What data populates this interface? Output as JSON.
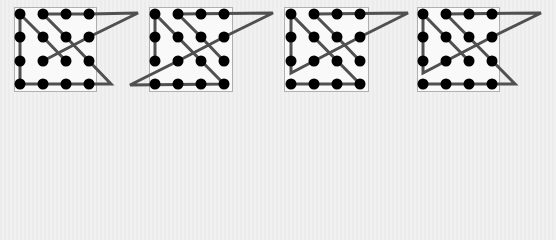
{
  "colors": {
    "background": "#eeeeee",
    "box_fill": "#f9f9f9",
    "box_border": "#b0b0b0",
    "line": "#505050",
    "dot": "#000000"
  },
  "grid": {
    "rows_y": [
      14,
      37,
      61,
      84
    ],
    "dot_radius": 5.5
  },
  "panels": [
    {
      "name": "panel-1",
      "box": {
        "x": 14,
        "y": 7,
        "w": 82,
        "h": 84
      },
      "cols_x": [
        20,
        43,
        66,
        89
      ],
      "path": [
        [
          66,
          61
        ],
        [
          43,
          37
        ],
        [
          20,
          14
        ],
        [
          20,
          84
        ],
        [
          111,
          84
        ],
        [
          89,
          61
        ],
        [
          66,
          37
        ],
        [
          43,
          14
        ],
        [
          89,
          14
        ],
        [
          138,
          13
        ],
        [
          89,
          37
        ],
        [
          43,
          61
        ]
      ]
    },
    {
      "name": "panel-2",
      "box": {
        "x": 149,
        "y": 7,
        "w": 83,
        "h": 84
      },
      "cols_x": [
        155,
        178,
        201,
        224
      ],
      "path": [
        [
          224,
          61
        ],
        [
          201,
          37
        ],
        [
          178,
          14
        ],
        [
          273,
          13
        ],
        [
          224,
          37
        ],
        [
          178,
          61
        ],
        [
          130,
          85
        ],
        [
          224,
          84
        ],
        [
          155,
          14
        ],
        [
          155,
          61
        ]
      ]
    },
    {
      "name": "panel-3",
      "box": {
        "x": 284,
        "y": 7,
        "w": 84,
        "h": 84
      },
      "cols_x": [
        291,
        314,
        337,
        360
      ],
      "path": [
        [
          360,
          61
        ],
        [
          337,
          37
        ],
        [
          314,
          14
        ],
        [
          408,
          13
        ],
        [
          360,
          37
        ],
        [
          314,
          61
        ],
        [
          291,
          73
        ],
        [
          291,
          14
        ],
        [
          360,
          84
        ],
        [
          291,
          84
        ]
      ]
    },
    {
      "name": "panel-4",
      "box": {
        "x": 417,
        "y": 7,
        "w": 82,
        "h": 84
      },
      "cols_x": [
        423,
        446,
        469,
        492
      ],
      "path": [
        [
          469,
          61
        ],
        [
          423,
          14
        ],
        [
          423,
          73
        ],
        [
          446,
          61
        ],
        [
          492,
          37
        ],
        [
          541,
          13
        ],
        [
          446,
          14
        ],
        [
          515,
          84
        ],
        [
          423,
          84
        ]
      ]
    }
  ]
}
